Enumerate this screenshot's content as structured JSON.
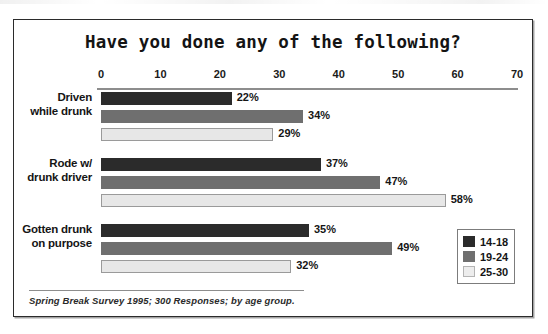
{
  "chart_data": {
    "type": "bar",
    "orientation": "horizontal",
    "title": "Have you done any of the following?",
    "xlabel": "",
    "ylabel": "",
    "xlim": [
      0,
      70
    ],
    "xticks": [
      0,
      10,
      20,
      30,
      40,
      50,
      60,
      70
    ],
    "xtick_labels": [
      "0",
      "10",
      "20",
      "30",
      "40",
      "50",
      "60",
      "70"
    ],
    "grid": false,
    "legend_position": "bottom-right",
    "value_suffix": "%",
    "categories": [
      "Driven while drunk",
      "Rode w/ drunk driver",
      "Gotten drunk on purpose"
    ],
    "category_lines": [
      [
        "Driven",
        "while drunk"
      ],
      [
        "Rode w/",
        "drunk driver"
      ],
      [
        "Gotten drunk",
        "on purpose"
      ]
    ],
    "series": [
      {
        "name": "14-18",
        "color": "#2b2b2b",
        "values": [
          22,
          37,
          35
        ],
        "labels": [
          "22%",
          "37%",
          "35%"
        ]
      },
      {
        "name": "19-24",
        "color": "#6f6f6f",
        "values": [
          34,
          47,
          49
        ],
        "labels": [
          "34%",
          "47%",
          "49%"
        ]
      },
      {
        "name": "25-30",
        "color": "#e7e7e7",
        "values": [
          29,
          58,
          32
        ],
        "labels": [
          "29%",
          "58%",
          "32%"
        ]
      }
    ],
    "footnote": "Spring Break Survey 1995; 300 Responses; by age group."
  },
  "legend": {
    "items": [
      {
        "label": "14-18",
        "swatch": "s0"
      },
      {
        "label": "19-24",
        "swatch": "s1"
      },
      {
        "label": "25-30",
        "swatch": "s2"
      }
    ]
  }
}
